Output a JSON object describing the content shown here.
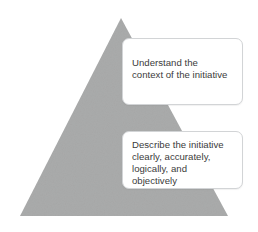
{
  "diagram": {
    "background_color": "#ffffff",
    "shape": {
      "name": "triangle",
      "fill_color": "#aaabab",
      "apex": [
        121,
        18
      ],
      "base_left": [
        20,
        216
      ],
      "base_right": [
        228,
        216
      ]
    },
    "callouts": [
      {
        "id": "understand",
        "text": "Understand the\ncontext of the initiative",
        "border_color": "#d2d4d6",
        "background_color": "#ffffff",
        "text_color": "#3b3b3b"
      },
      {
        "id": "describe",
        "text": "Describe the initiative\nclearly, accurately,\nlogically, and\nobjectively",
        "border_color": "#d2d4d6",
        "background_color": "#ffffff",
        "text_color": "#3b3b3b"
      }
    ]
  }
}
